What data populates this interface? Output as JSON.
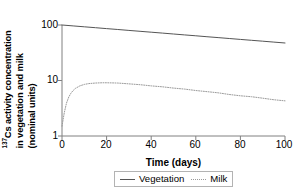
{
  "chart_data": {
    "type": "line",
    "title": "",
    "xlabel": "Time (days)",
    "ylabel_lines": [
      "Cs activity concentration",
      "in vegetation and milk",
      "(nominal units)"
    ],
    "ylabel_superscript": "137",
    "xlim": [
      0,
      100
    ],
    "ylim": [
      1,
      100
    ],
    "yscale": "log",
    "xscale": "linear",
    "grid": false,
    "legend_position": "bottom-center",
    "xticks": [
      0,
      20,
      40,
      60,
      80,
      100
    ],
    "xtick_labels": [
      "0",
      "20",
      "40",
      "60",
      "80",
      "100"
    ],
    "yticks": [
      1,
      10,
      100
    ],
    "ytick_labels": [
      "1",
      "10",
      "100"
    ],
    "series": [
      {
        "name": "Vegetation",
        "style": "solid",
        "color": "#555555",
        "x": [
          0,
          5,
          10,
          15,
          20,
          25,
          30,
          35,
          40,
          45,
          50,
          55,
          60,
          65,
          70,
          75,
          80,
          85,
          90,
          95,
          100
        ],
        "values": [
          100,
          96.3,
          92.8,
          89.4,
          86.1,
          83.0,
          79.9,
          77.0,
          74.2,
          71.5,
          68.8,
          66.3,
          63.9,
          61.5,
          59.3,
          57.1,
          55.0,
          53.0,
          51.1,
          49.2,
          47.4
        ]
      },
      {
        "name": "Milk",
        "style": "dotted",
        "color": "#9a9a9a",
        "x": [
          0,
          1,
          2,
          3,
          4,
          5,
          6,
          8,
          10,
          12,
          15,
          18,
          20,
          25,
          30,
          35,
          40,
          45,
          50,
          55,
          60,
          65,
          70,
          75,
          80,
          85,
          90,
          95,
          100
        ],
        "values": [
          1.5,
          2.6,
          3.9,
          5.0,
          5.9,
          6.6,
          7.2,
          8.0,
          8.5,
          8.8,
          9.0,
          9.1,
          9.1,
          9.0,
          8.7,
          8.4,
          8.0,
          7.7,
          7.3,
          7.0,
          6.6,
          6.3,
          6.0,
          5.6,
          5.3,
          5.1,
          4.8,
          4.5,
          4.3
        ]
      }
    ]
  },
  "legend": {
    "items": [
      {
        "label": "Vegetation",
        "style": "solid"
      },
      {
        "label": "Milk",
        "style": "dotted"
      }
    ]
  },
  "axis_colors": {
    "axis_line": "#808080",
    "vegetation": "#555555",
    "milk": "#9a9a9a",
    "legend_border": "#b3b3b3"
  }
}
